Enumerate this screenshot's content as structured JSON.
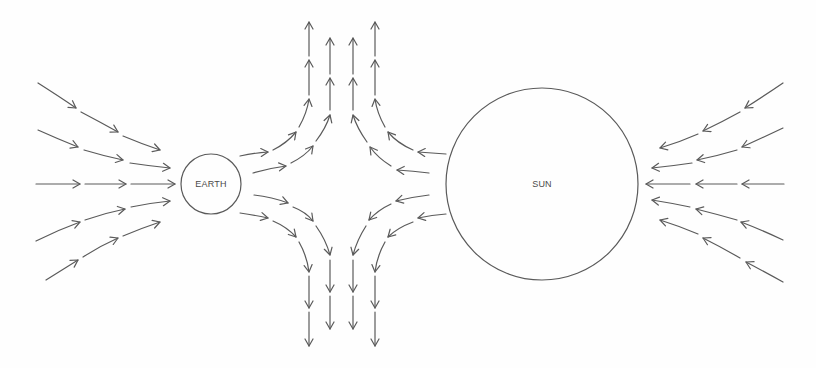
{
  "diagram": {
    "type": "field-line diagram",
    "stroke_color": "#5a5a5a",
    "bodies": [
      {
        "id": "earth",
        "label": "EARTH",
        "cx": 211,
        "cy": 184,
        "r": 30
      },
      {
        "id": "sun",
        "label": "SUN",
        "cx": 542,
        "cy": 184,
        "r": 96
      }
    ],
    "flow_groups": [
      {
        "name": "left-inflow-to-earth",
        "direction": "right",
        "lines": [
          [
            "M38 83 Q60 97 76 108",
            "M81 112 Q100 122 118 132",
            "M123 136 Q142 144 160 150"
          ],
          [
            "M38 130 Q58 139 78 147",
            "M84 150 Q104 156 123 160",
            "M130 163 Q150 166 170 168"
          ],
          [
            "M36 184 L80 184",
            "M85 184 L126 184",
            "M131 184 L175 184"
          ],
          [
            "M36 241 Q58 230 80 222",
            "M85 220 Q105 213 125 209",
            "M131 207 Q150 203 170 201"
          ],
          [
            "M46 280 Q62 270 78 260",
            "M83 257 Q100 246 118 238",
            "M123 236 Q142 228 160 222"
          ]
        ]
      },
      {
        "name": "right-inflow-to-sun",
        "direction": "left",
        "lines": [
          [
            "M783 83 Q764 96 745 108",
            "M740 112 Q722 122 703 131",
            "M698 134 Q680 142 660 148"
          ],
          [
            "M783 128 Q762 138 742 147",
            "M737 150 Q717 156 697 160",
            "M692 163 Q672 166 652 168"
          ],
          [
            "M784 184 L742 184",
            "M737 184 L696 184",
            "M690 184 L646 184"
          ],
          [
            "M783 240 Q762 230 741 222",
            "M737 220 Q716 214 696 209",
            "M690 207 Q671 203 652 200"
          ],
          [
            "M783 282 Q765 272 746 262",
            "M740 258 Q721 247 703 238",
            "M698 234 Q679 226 660 220"
          ]
        ]
      },
      {
        "name": "upper-outflow-from-earth",
        "direction": "up",
        "lines": [
          [
            "M240 156 Q254 153 268 152",
            "M273 150 Q287 143 296 132",
            "M299 127 Q307 113 309 99",
            "M309 95 L309 60",
            "M309 56 L309 22"
          ],
          [
            "M253 173 Q270 168 286 166",
            "M291 163 Q305 156 313 146",
            "M316 141 Q326 128 330 115",
            "M330 110 L330 78",
            "M330 74 L330 38"
          ]
        ]
      },
      {
        "name": "upper-outflow-from-sun",
        "direction": "up",
        "lines": [
          [
            "M446 154 Q432 153 418 152",
            "M413 150 Q397 143 388 132",
            "M385 127 Q377 113 375 99",
            "M375 95 L375 60",
            "M375 56 L375 22"
          ],
          [
            "M429 173 Q413 171 397 170",
            "M391 166 Q378 158 370 147",
            "M367 142 Q357 128 353 115",
            "M353 110 L353 78",
            "M353 74 L353 38"
          ]
        ]
      },
      {
        "name": "lower-outflow-from-earth",
        "direction": "down",
        "lines": [
          [
            "M254 195 Q272 197 288 203",
            "M293 207 Q306 212 313 221",
            "M316 226 Q326 240 330 255",
            "M330 260 L330 292",
            "M330 296 L330 329"
          ],
          [
            "M240 213 Q254 215 268 218",
            "M273 221 Q287 227 296 237",
            "M299 242 Q307 256 309 272",
            "M309 276 L309 308",
            "M309 312 L309 346"
          ]
        ]
      },
      {
        "name": "lower-outflow-from-sun",
        "direction": "down",
        "lines": [
          [
            "M429 195 Q412 197 396 201",
            "M391 204 Q378 210 369 220",
            "M366 226 Q357 240 353 255",
            "M353 260 L353 292",
            "M353 296 L353 329"
          ],
          [
            "M446 214 Q432 215 418 218",
            "M413 222 Q397 228 388 237",
            "M385 242 Q377 256 375 272",
            "M375 276 L375 308",
            "M375 312 L375 346"
          ]
        ]
      }
    ]
  }
}
